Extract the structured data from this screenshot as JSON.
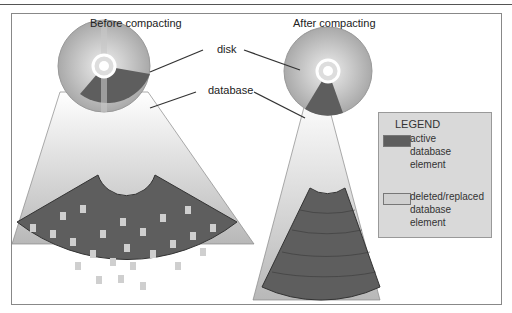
{
  "header": {
    "title_fragment": ""
  },
  "diagram": {
    "left_title": "Before compacting",
    "right_title": "After compacting",
    "label_disk": "disk",
    "label_database": "database"
  },
  "legend": {
    "title": "LEGEND",
    "items": [
      {
        "label": "active database element",
        "lines": [
          "active",
          "database",
          "element"
        ],
        "color": "#5e5e5e"
      },
      {
        "label": "deleted/replaced database element",
        "lines": [
          "deleted/replaced",
          "database",
          "element"
        ],
        "color": "#d0d0d0"
      }
    ]
  },
  "colors": {
    "active": "#5e5e5e",
    "deleted": "#cfcfcf",
    "disk": "#aaaaaa",
    "legend_bg": "#d9d9d9"
  }
}
